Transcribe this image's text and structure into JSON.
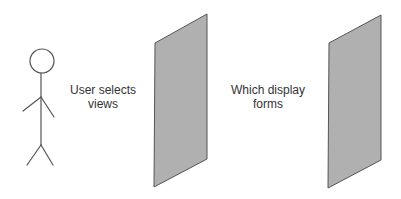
{
  "diagram": {
    "actor": {
      "role": "user"
    },
    "labels": [
      {
        "line1": "User selects",
        "line2": "views"
      },
      {
        "line1": "Which display",
        "line2": "forms"
      }
    ],
    "colors": {
      "panel_fill": "#b0b0b0",
      "panel_stroke": "#555555",
      "figure_stroke": "#555555",
      "text": "#333333"
    }
  }
}
